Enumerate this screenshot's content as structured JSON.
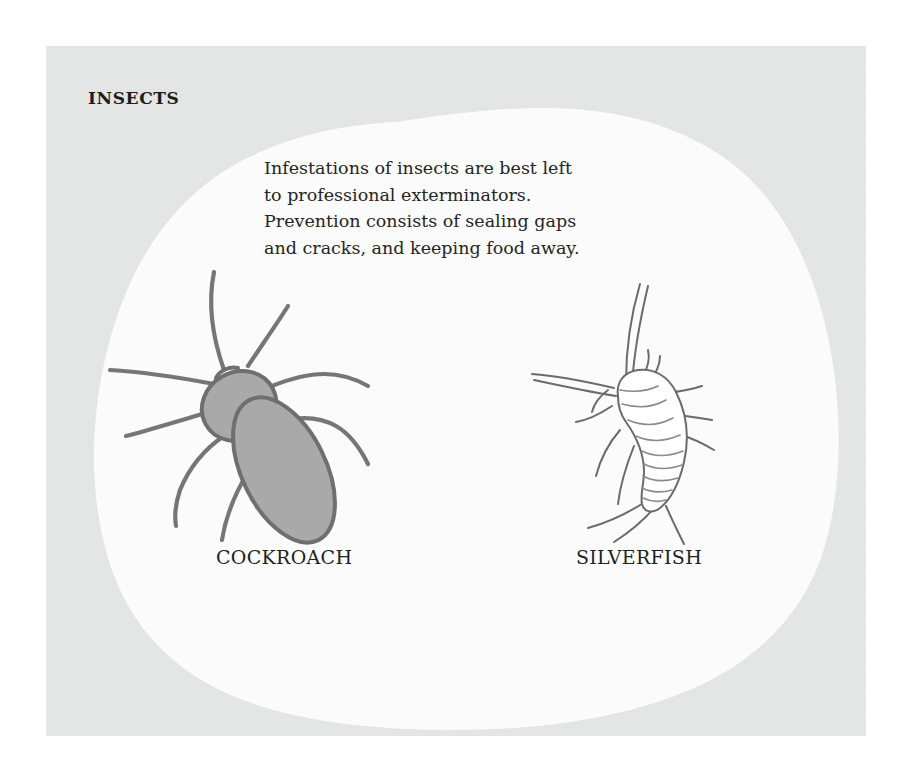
{
  "page": {
    "panel_color": "#e6e7e7",
    "blob_color": "#fbfbfb",
    "page_color": "#ffffff"
  },
  "heading": {
    "title": "INSECTS"
  },
  "body": {
    "lines": [
      "Infestations of insects are best left",
      "to professional exterminators.",
      "Prevention consists of sealing gaps",
      "and cracks, and keeping food away."
    ],
    "full_text": "Infestations of insects are best left to professional exterminators. Prevention consists of sealing gaps and cracks, and keeping food away."
  },
  "figures": [
    {
      "id": "cockroach",
      "caption": "COCKROACH",
      "icon": "cockroach-illustration",
      "style": "filled",
      "fill_color": "#a9a9a9",
      "stroke_color": "#6f6f6f"
    },
    {
      "id": "silverfish",
      "caption": "SILVERFISH",
      "icon": "silverfish-illustration",
      "style": "line-art",
      "fill_color": "#ffffff",
      "stroke_color": "#6b6b6b"
    }
  ]
}
